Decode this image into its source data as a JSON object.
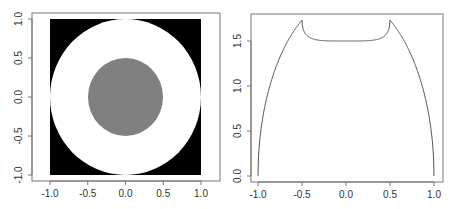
{
  "chart_data": [
    {
      "type": "heatmap",
      "title": "",
      "xlabel": "",
      "ylabel": "",
      "xlim": [
        -1.0,
        1.0
      ],
      "ylim": [
        -1.0,
        1.0
      ],
      "grid": false,
      "description": "Square image on [-1,1]^2: black background, white disk of radius 1, grey disk of radius 0.5 centered at origin",
      "regions": [
        {
          "name": "outside unit circle",
          "color": "#000000"
        },
        {
          "name": "annulus 0.5 < r < 1",
          "color": "#ffffff"
        },
        {
          "name": "inner disk r < 0.5",
          "color": "#808080"
        }
      ],
      "x_ticks": [
        "-1.0",
        "-0.5",
        "0.0",
        "0.5",
        "1.0"
      ],
      "y_ticks": [
        "-1.0",
        "-0.5",
        "0.0",
        "0.5",
        "1.0"
      ]
    },
    {
      "type": "line",
      "title": "",
      "xlabel": "",
      "ylabel": "",
      "xlim": [
        -1.0,
        1.0
      ],
      "ylim": [
        0.0,
        1.75
      ],
      "grid": false,
      "x_ticks": [
        "-1.0",
        "-0.5",
        "0.0",
        "0.5",
        "1.0"
      ],
      "y_ticks": [
        "0.0",
        "0.5",
        "1.0",
        "1.5"
      ],
      "series": [
        {
          "name": "profile",
          "x": [
            -1.0,
            -0.95,
            -0.9,
            -0.8,
            -0.7,
            -0.6,
            -0.5,
            -0.45,
            -0.4,
            -0.3,
            -0.2,
            -0.1,
            0.0,
            0.1,
            0.2,
            0.3,
            0.4,
            0.45,
            0.5,
            0.6,
            0.7,
            0.8,
            0.9,
            0.95,
            1.0
          ],
          "values": [
            0.0,
            0.62,
            0.87,
            1.2,
            1.43,
            1.6,
            1.73,
            1.57,
            1.53,
            1.51,
            1.5,
            1.5,
            1.5,
            1.5,
            1.5,
            1.51,
            1.53,
            1.57,
            1.73,
            1.6,
            1.43,
            1.2,
            0.87,
            0.62,
            0.0
          ]
        }
      ]
    }
  ],
  "left_plot": {
    "x_ticks": [
      "-1.0",
      "-0.5",
      "0.0",
      "0.5",
      "1.0"
    ],
    "y_ticks": [
      "-1.0",
      "-0.5",
      "0.0",
      "0.5",
      "1.0"
    ],
    "colors": {
      "background": "#000000",
      "annulus": "#ffffff",
      "inner": "#808080"
    }
  },
  "right_plot": {
    "x_ticks": [
      "-1.0",
      "-0.5",
      "0.0",
      "0.5",
      "1.0"
    ],
    "y_ticks": [
      "0.0",
      "0.5",
      "1.0",
      "1.5"
    ],
    "line_color": "#555555"
  }
}
